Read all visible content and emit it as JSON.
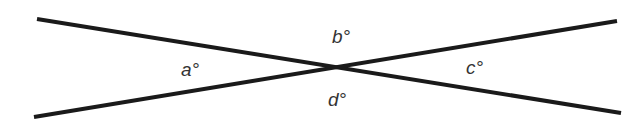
{
  "diagram": {
    "type": "intersecting-lines",
    "lines": [
      {
        "name": "line-1",
        "x1": 37,
        "y1": 19,
        "x2": 621,
        "y2": 113
      },
      {
        "name": "line-2",
        "x1": 34,
        "y1": 117,
        "x2": 617,
        "y2": 21
      }
    ],
    "intersection": {
      "x": 337,
      "y": 67
    },
    "line_color": "#1a1a1a",
    "labels": {
      "a": "a°",
      "b": "b°",
      "c": "c°",
      "d": "d°"
    }
  }
}
